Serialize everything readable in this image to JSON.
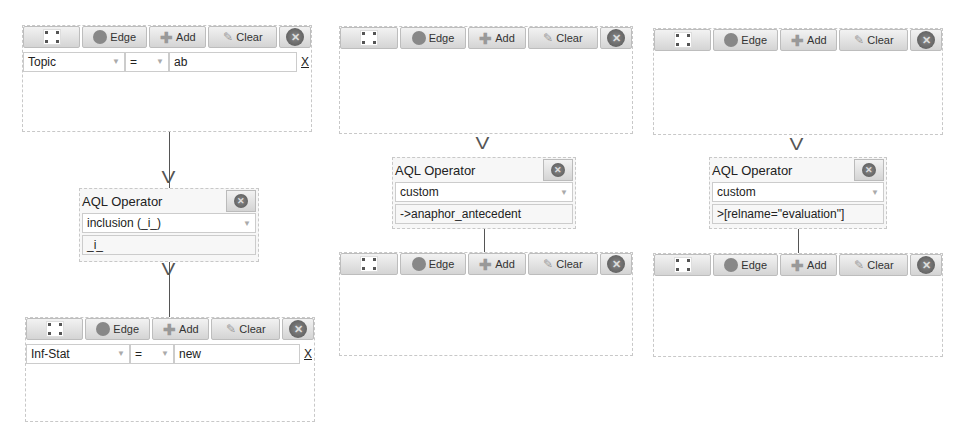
{
  "toolbar": {
    "expand_icon": "expand-icon",
    "edge_label": "Edge",
    "add_label": "Add",
    "clear_label": "Clear",
    "close_icon": "close-circle-icon"
  },
  "panels": [
    {
      "node1": {
        "attribute": "Topic",
        "operator": "=",
        "value": "ab",
        "remove": "X"
      },
      "aql": {
        "title": "AQL Operator",
        "selected": "inclusion (_i_)",
        "expression": "_i_"
      },
      "node2": {
        "attribute": "Inf-Stat",
        "operator": "=",
        "value": "new",
        "remove": "X"
      }
    },
    {
      "aql": {
        "title": "AQL Operator",
        "selected": "custom",
        "expression": "->anaphor_antecedent"
      }
    },
    {
      "aql": {
        "title": "AQL Operator",
        "selected": "custom",
        "expression": ">[relname=\"evaluation\"]"
      }
    }
  ],
  "arrow_glyph": "V"
}
